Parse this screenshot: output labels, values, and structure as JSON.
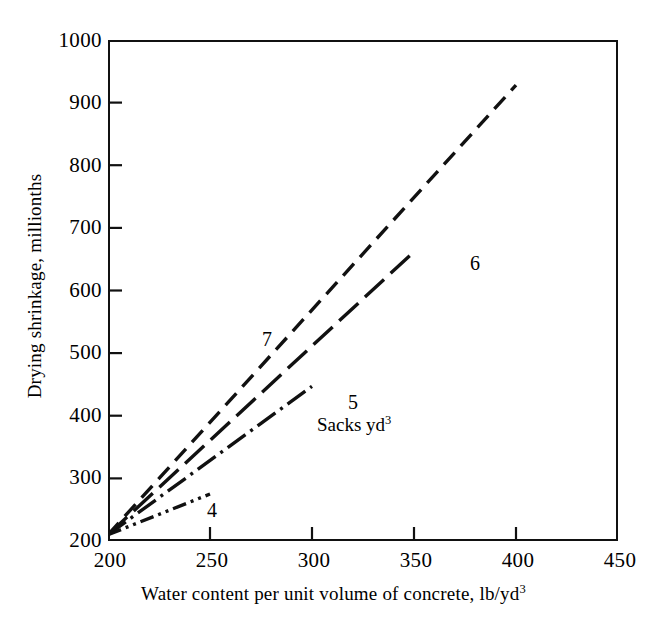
{
  "chart_data": {
    "type": "line",
    "title": "",
    "xlabel": "Water content per unit volume of concrete, lb/yd3",
    "xlabel_text": "Water content per unit volume of concrete, lb/yd",
    "xlabel_sup": "3",
    "ylabel": "Drying shrinkage, millionths",
    "xlim": [
      200,
      450
    ],
    "ylim": [
      200,
      1000
    ],
    "xticks": [
      200,
      250,
      300,
      350,
      400,
      450
    ],
    "yticks": [
      200,
      300,
      400,
      500,
      600,
      700,
      800,
      900,
      1000
    ],
    "xtick_labels": [
      "200",
      "250",
      "300",
      "350",
      "400",
      "450"
    ],
    "ytick_labels": [
      "200",
      "300",
      "400",
      "500",
      "600",
      "700",
      "800",
      "900",
      "1000"
    ],
    "grid": false,
    "legend_position": "inline-annotations",
    "unit_note": "Sacks yd",
    "unit_note_sup": "3",
    "line_color": "#111111",
    "series": [
      {
        "name": "4",
        "label": "4",
        "dash": "dash-dot-dot",
        "dasharray": "14,5,3,5,3,5",
        "x": [
          200,
          250
        ],
        "y": [
          210,
          275
        ],
        "label_x": 252,
        "label_y": 262
      },
      {
        "name": "5",
        "label": "5",
        "dash": "dash-dot",
        "dasharray": "22,6,3,6",
        "x": [
          200,
          300
        ],
        "y": [
          210,
          447
        ],
        "label_x": 303,
        "label_y": 422
      },
      {
        "name": "6",
        "label": "6",
        "dash": "long-dash",
        "dasharray": "26,9",
        "x": [
          200,
          350
        ],
        "y": [
          210,
          662
        ],
        "label_x": 353,
        "label_y": 640
      },
      {
        "name": "7",
        "label": "7",
        "dash": "short-dash",
        "dasharray": "16,9",
        "x": [
          200,
          400
        ],
        "y": [
          210,
          928
        ],
        "label_x": 230,
        "label_y": 537
      }
    ]
  },
  "axes": {
    "x_title_text": "Water content per unit volume of concrete, lb/yd",
    "x_title_sup": "3",
    "y_title_text": "Drying shrinkage, millionths"
  },
  "annotations": {
    "unit_note_text": "Sacks yd",
    "unit_note_sup": "3",
    "label_4": "4",
    "label_5": "5",
    "label_6": "6",
    "label_7": "7"
  }
}
